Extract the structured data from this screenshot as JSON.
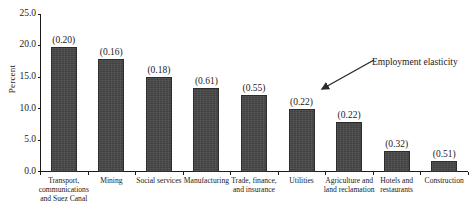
{
  "chart_data": {
    "type": "bar",
    "title": "",
    "xlabel": "",
    "ylabel": "Percent",
    "ylim": [
      0.0,
      25.0
    ],
    "yticks": [
      "0.0",
      "5.0",
      "10.0",
      "15.0",
      "20.0",
      "25.0"
    ],
    "ytick_values": [
      0.0,
      5.0,
      10.0,
      15.0,
      20.0,
      25.0
    ],
    "grid": false,
    "legend": "none",
    "categories": [
      "Transport, communications and Suez Canal",
      "Mining",
      "Social services",
      "Manufacturing",
      "Trade, finance, and insurance",
      "Utilities",
      "Agriculture and land reclamation",
      "Hotels and restaurants",
      "Construction"
    ],
    "values": [
      19.8,
      17.9,
      15.0,
      13.3,
      12.2,
      10.0,
      7.9,
      3.3,
      1.8
    ],
    "data_labels": [
      "(0.20)",
      "(0.16)",
      "(0.18)",
      "(0.61)",
      "(0.55)",
      "(0.22)",
      "(0.22)",
      "(0.32)",
      "(0.51)"
    ],
    "data_label_meaning": "Employment elasticity",
    "annotations": [
      {
        "text": "Employment elasticity",
        "points_to": "(0.22)"
      }
    ],
    "colors": {
      "bar_fill": "#474747",
      "bar_edge": "#2d2d2d",
      "axis": "#1a1a1a",
      "background": "#ffffff",
      "text": "#1a1a1a"
    }
  }
}
